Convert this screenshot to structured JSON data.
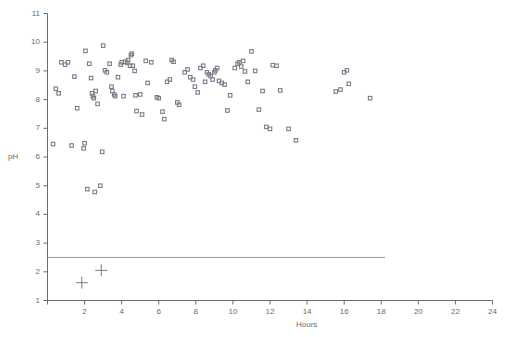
{
  "chart_data": {
    "type": "scatter",
    "title": "",
    "xlabel": "Hours",
    "ylabel": "pH",
    "xlim": [
      0,
      24
    ],
    "ylim": [
      1,
      11
    ],
    "grid": false,
    "legend": null,
    "xticks": [
      0,
      2,
      4,
      6,
      8,
      10,
      12,
      14,
      16,
      18,
      20,
      22,
      24
    ],
    "xticklabels": [
      "",
      "2",
      "4",
      "6",
      "8",
      "10",
      "12",
      "14",
      "16",
      "18",
      "20",
      "22",
      "24"
    ],
    "yticks": [
      1,
      2,
      3,
      4,
      5,
      6,
      7,
      8,
      9,
      10,
      11
    ],
    "yticklabels": [
      "1",
      "2",
      "3",
      "4",
      "5",
      "6",
      "7",
      "8",
      "9",
      "10",
      "11"
    ],
    "marker_color": "#7a7a8a",
    "line_color": "#9a9a9a",
    "axis_color": "#6b6b6b",
    "annotations": [
      {
        "name": "threshold-line",
        "type": "hline",
        "y": 2.5,
        "x_start": 0.0,
        "x_end": 18.2,
        "color": "#9a9a9a"
      }
    ],
    "series": [
      {
        "name": "pH measurements",
        "marker": "square",
        "points": [
          [
            0.3,
            6.45
          ],
          [
            0.45,
            8.38
          ],
          [
            0.6,
            8.22
          ],
          [
            0.75,
            9.3
          ],
          [
            0.95,
            9.22
          ],
          [
            1.1,
            9.3
          ],
          [
            1.3,
            6.4
          ],
          [
            1.45,
            8.8
          ],
          [
            1.6,
            7.7
          ],
          [
            1.95,
            6.3
          ],
          [
            2.0,
            6.48
          ],
          [
            2.05,
            9.7
          ],
          [
            2.15,
            4.88
          ],
          [
            2.25,
            9.25
          ],
          [
            2.35,
            8.75
          ],
          [
            2.4,
            8.22
          ],
          [
            2.45,
            8.12
          ],
          [
            2.5,
            8.05
          ],
          [
            2.55,
            4.78
          ],
          [
            2.6,
            8.3
          ],
          [
            2.7,
            7.85
          ],
          [
            2.85,
            5.0
          ],
          [
            2.95,
            6.18
          ],
          [
            3.0,
            9.88
          ],
          [
            3.1,
            9.02
          ],
          [
            3.2,
            8.95
          ],
          [
            3.35,
            9.25
          ],
          [
            3.45,
            8.45
          ],
          [
            3.5,
            8.3
          ],
          [
            3.6,
            8.18
          ],
          [
            3.65,
            8.12
          ],
          [
            3.8,
            8.78
          ],
          [
            3.95,
            9.22
          ],
          [
            4.0,
            9.3
          ],
          [
            4.1,
            8.12
          ],
          [
            4.2,
            9.32
          ],
          [
            4.3,
            9.28
          ],
          [
            4.35,
            9.38
          ],
          [
            4.45,
            9.18
          ],
          [
            4.5,
            9.55
          ],
          [
            4.55,
            9.6
          ],
          [
            4.6,
            9.18
          ],
          [
            4.7,
            9.0
          ],
          [
            4.75,
            8.15
          ],
          [
            4.8,
            7.6
          ],
          [
            5.0,
            8.18
          ],
          [
            5.1,
            7.48
          ],
          [
            5.3,
            9.35
          ],
          [
            5.4,
            8.58
          ],
          [
            5.6,
            9.3
          ],
          [
            5.9,
            8.08
          ],
          [
            6.0,
            8.05
          ],
          [
            6.2,
            7.58
          ],
          [
            6.3,
            7.32
          ],
          [
            6.45,
            8.62
          ],
          [
            6.6,
            8.7
          ],
          [
            6.7,
            9.38
          ],
          [
            6.8,
            9.32
          ],
          [
            7.0,
            7.9
          ],
          [
            7.1,
            7.82
          ],
          [
            7.4,
            8.95
          ],
          [
            7.55,
            9.05
          ],
          [
            7.7,
            8.78
          ],
          [
            7.85,
            8.7
          ],
          [
            7.95,
            8.45
          ],
          [
            8.1,
            8.25
          ],
          [
            8.25,
            9.1
          ],
          [
            8.4,
            9.18
          ],
          [
            8.5,
            8.62
          ],
          [
            8.6,
            8.95
          ],
          [
            8.7,
            8.88
          ],
          [
            8.8,
            8.82
          ],
          [
            8.9,
            8.7
          ],
          [
            9.0,
            8.95
          ],
          [
            9.05,
            9.02
          ],
          [
            9.15,
            9.1
          ],
          [
            9.25,
            8.65
          ],
          [
            9.4,
            8.58
          ],
          [
            9.55,
            8.52
          ],
          [
            9.7,
            7.62
          ],
          [
            9.85,
            8.15
          ],
          [
            10.1,
            9.1
          ],
          [
            10.25,
            9.25
          ],
          [
            10.35,
            9.3
          ],
          [
            10.45,
            9.15
          ],
          [
            10.55,
            9.35
          ],
          [
            10.65,
            8.98
          ],
          [
            10.8,
            8.62
          ],
          [
            11.0,
            9.68
          ],
          [
            11.2,
            9.0
          ],
          [
            11.4,
            7.65
          ],
          [
            11.6,
            8.3
          ],
          [
            11.8,
            7.05
          ],
          [
            12.0,
            6.98
          ],
          [
            12.15,
            9.2
          ],
          [
            12.35,
            9.18
          ],
          [
            12.55,
            8.32
          ],
          [
            13.0,
            6.98
          ],
          [
            13.4,
            6.58
          ],
          [
            15.55,
            8.28
          ],
          [
            15.8,
            8.35
          ],
          [
            16.0,
            8.95
          ],
          [
            16.15,
            9.02
          ],
          [
            16.25,
            8.55
          ],
          [
            17.4,
            8.05
          ]
        ]
      },
      {
        "name": "control markers",
        "marker": "plus",
        "points": [
          [
            1.85,
            1.62
          ],
          [
            2.9,
            2.05
          ]
        ]
      }
    ]
  },
  "axis": {
    "x_title": "Hours",
    "y_title": "pH"
  }
}
